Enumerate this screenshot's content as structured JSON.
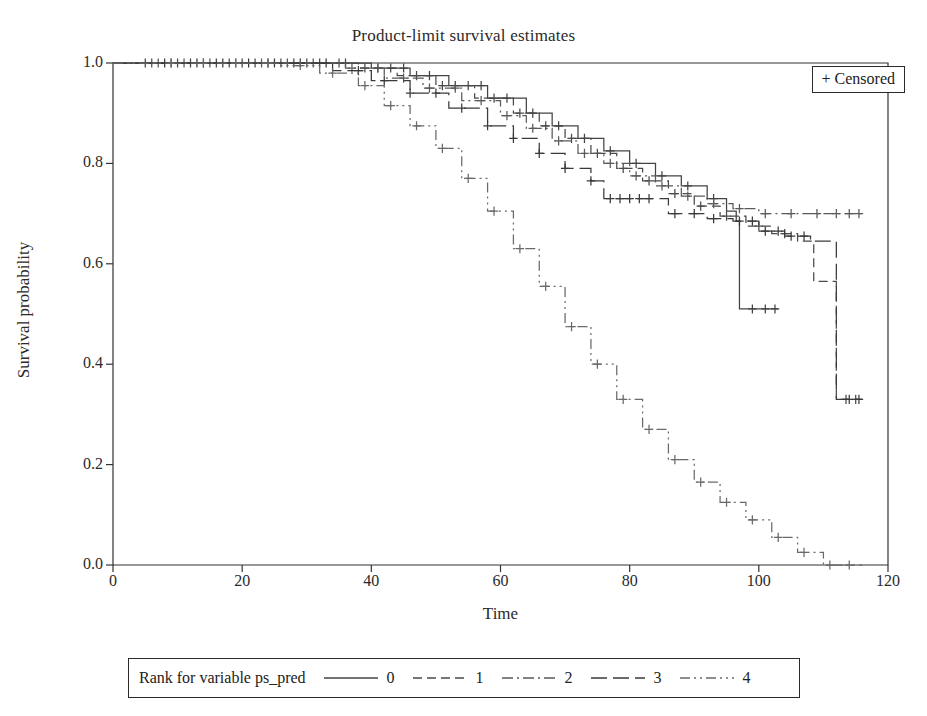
{
  "chart_data": {
    "type": "line",
    "title": "Product-limit survival estimates",
    "xlabel": "Time",
    "ylabel": "Survival probability",
    "xlim": [
      0,
      120
    ],
    "ylim": [
      0.0,
      1.0
    ],
    "xticks": [
      0,
      20,
      40,
      60,
      80,
      100,
      120
    ],
    "yticks": [
      "0.0",
      "0.2",
      "0.4",
      "0.6",
      "0.8",
      "1.0"
    ],
    "grid": false,
    "legend_position": "below-plot",
    "legend_title": "Rank for variable ps_pred",
    "censored_marker_label": "+ Censored",
    "series": [
      {
        "name": "0",
        "dash": "solid",
        "color": "#444444",
        "points": [
          [
            0,
            1.0
          ],
          [
            34,
            1.0
          ],
          [
            40,
            0.99
          ],
          [
            46,
            0.975
          ],
          [
            52,
            0.955
          ],
          [
            58,
            0.93
          ],
          [
            64,
            0.9
          ],
          [
            68,
            0.875
          ],
          [
            72,
            0.85
          ],
          [
            76,
            0.825
          ],
          [
            80,
            0.8
          ],
          [
            84,
            0.775
          ],
          [
            88,
            0.755
          ],
          [
            92,
            0.73
          ],
          [
            95,
            0.705
          ],
          [
            96.5,
            0.685
          ],
          [
            97,
            0.51
          ],
          [
            103,
            0.51
          ]
        ],
        "censored": [
          5,
          9,
          12,
          16,
          20,
          24,
          28,
          32,
          36,
          41,
          45,
          49,
          53,
          57,
          61,
          65,
          69,
          73,
          77,
          81,
          85,
          89,
          93,
          99,
          101,
          102.5
        ]
      },
      {
        "name": "1",
        "dash": "dashed",
        "color": "#4a4a4a",
        "points": [
          [
            0,
            1.0
          ],
          [
            32,
            1.0
          ],
          [
            38,
            0.99
          ],
          [
            44,
            0.975
          ],
          [
            50,
            0.955
          ],
          [
            56,
            0.93
          ],
          [
            62,
            0.9
          ],
          [
            66,
            0.875
          ],
          [
            70,
            0.85
          ],
          [
            74,
            0.82
          ],
          [
            78,
            0.79
          ],
          [
            82,
            0.765
          ],
          [
            86,
            0.74
          ],
          [
            90,
            0.715
          ],
          [
            94,
            0.695
          ],
          [
            98,
            0.675
          ],
          [
            102,
            0.66
          ],
          [
            106,
            0.645
          ],
          [
            108,
            0.645
          ],
          [
            108.5,
            0.565
          ],
          [
            111.5,
            0.565
          ],
          [
            112,
            0.33
          ],
          [
            116,
            0.33
          ]
        ],
        "censored": [
          6,
          10,
          14,
          18,
          22,
          26,
          30,
          35,
          39,
          43,
          47,
          51,
          55,
          59,
          63,
          67,
          71,
          75,
          79,
          83,
          87,
          91,
          95,
          100,
          104,
          113.5,
          115
        ]
      },
      {
        "name": "2",
        "dash": "dashdot",
        "color": "#5a5a5a",
        "points": [
          [
            0,
            1.0
          ],
          [
            30,
            1.0
          ],
          [
            36,
            0.99
          ],
          [
            42,
            0.97
          ],
          [
            48,
            0.95
          ],
          [
            54,
            0.925
          ],
          [
            60,
            0.895
          ],
          [
            64,
            0.87
          ],
          [
            68,
            0.845
          ],
          [
            72,
            0.82
          ],
          [
            76,
            0.8
          ],
          [
            80,
            0.775
          ],
          [
            84,
            0.755
          ],
          [
            88,
            0.735
          ],
          [
            92,
            0.72
          ],
          [
            96,
            0.71
          ],
          [
            100,
            0.7
          ],
          [
            116,
            0.7
          ]
        ],
        "censored": [
          7,
          11,
          15,
          19,
          23,
          27,
          31,
          37,
          41,
          45,
          49,
          53,
          57,
          61,
          65,
          69,
          73,
          77,
          81,
          85,
          89,
          93,
          97,
          101,
          105,
          109,
          112,
          114,
          115.5
        ]
      },
      {
        "name": "3",
        "dash": "longdash",
        "color": "#3a3a3a",
        "points": [
          [
            0,
            1.0
          ],
          [
            28,
            1.0
          ],
          [
            34,
            0.985
          ],
          [
            40,
            0.965
          ],
          [
            46,
            0.94
          ],
          [
            52,
            0.91
          ],
          [
            58,
            0.875
          ],
          [
            62,
            0.85
          ],
          [
            66,
            0.82
          ],
          [
            70,
            0.79
          ],
          [
            74,
            0.765
          ],
          [
            76,
            0.73
          ],
          [
            84,
            0.73
          ],
          [
            86,
            0.7
          ],
          [
            92,
            0.69
          ],
          [
            96,
            0.685
          ],
          [
            100,
            0.665
          ],
          [
            104,
            0.655
          ],
          [
            108,
            0.645
          ],
          [
            111.5,
            0.645
          ],
          [
            112,
            0.33
          ],
          [
            116,
            0.33
          ]
        ],
        "censored": [
          8,
          13,
          17,
          21,
          25,
          29,
          33,
          38,
          42,
          46,
          50,
          54,
          58,
          62,
          66,
          70,
          74,
          77,
          78.5,
          80,
          81.5,
          83,
          87,
          90,
          93,
          97,
          99,
          101,
          103,
          105,
          107,
          114,
          115.5
        ]
      },
      {
        "name": "4",
        "dash": "dashdotdot",
        "color": "#6a6a6a",
        "points": [
          [
            0,
            1.0
          ],
          [
            22,
            1.0
          ],
          [
            26,
            0.995
          ],
          [
            32,
            0.98
          ],
          [
            38,
            0.955
          ],
          [
            42,
            0.915
          ],
          [
            46,
            0.875
          ],
          [
            50,
            0.83
          ],
          [
            54,
            0.77
          ],
          [
            58,
            0.705
          ],
          [
            62,
            0.63
          ],
          [
            66,
            0.555
          ],
          [
            70,
            0.475
          ],
          [
            74,
            0.4
          ],
          [
            78,
            0.33
          ],
          [
            82,
            0.27
          ],
          [
            86,
            0.21
          ],
          [
            90,
            0.165
          ],
          [
            94,
            0.125
          ],
          [
            98,
            0.09
          ],
          [
            102,
            0.055
          ],
          [
            106,
            0.025
          ],
          [
            110,
            0.0
          ],
          [
            116,
            0.0
          ]
        ],
        "censored": [
          9,
          14,
          19,
          24,
          29,
          34,
          39,
          43,
          47,
          51,
          55,
          59,
          63,
          67,
          71,
          75,
          79,
          83,
          87,
          91,
          95,
          99,
          103,
          107,
          111,
          114
        ]
      }
    ]
  },
  "legend": {
    "title": "Rank for variable ps_pred",
    "items": [
      {
        "label": "0"
      },
      {
        "label": "1"
      },
      {
        "label": "2"
      },
      {
        "label": "3"
      },
      {
        "label": "4"
      }
    ]
  },
  "censored_box": {
    "label": "+ Censored"
  }
}
